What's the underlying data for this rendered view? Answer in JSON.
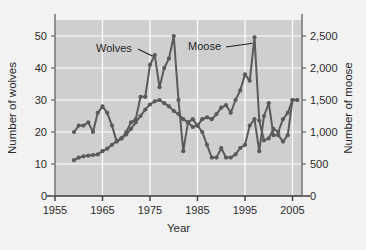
{
  "figure": {
    "background": "#f2f2f2",
    "plot_background": "#cfcfcf",
    "grid_color": "#ffffff",
    "axis_color": "#7a7a7a",
    "series_color": "#5a5a5a"
  },
  "labels": {
    "wolves_label": "Wolves",
    "moose_label": "Moose",
    "left_axis_title": "Number of wolves",
    "right_axis_title": "Number of moose",
    "x_axis_title": "Year"
  },
  "axes": {
    "x_ticks": [
      "1955",
      "1965",
      "1975",
      "1985",
      "1995",
      "2005"
    ],
    "y_left_ticks": [
      "0",
      "10",
      "20",
      "30",
      "40",
      "50"
    ],
    "y_right_ticks": [
      "0",
      "500",
      "1,000",
      "1,500",
      "2,000",
      "2,500"
    ]
  },
  "chart_data": {
    "type": "line",
    "title": "",
    "xlabel": "Year",
    "ylabel": "Number of wolves",
    "y2label": "Number of moose",
    "xlim": [
      1955,
      2007
    ],
    "ylim": [
      0,
      55
    ],
    "y2lim": [
      0,
      2750
    ],
    "grid": true,
    "legend": "annotated-inline",
    "x_ticks": [
      1955,
      1965,
      1975,
      1985,
      1995,
      2005
    ],
    "y_ticks": [
      0,
      10,
      20,
      30,
      40,
      50
    ],
    "y2_ticks": [
      0,
      500,
      1000,
      1500,
      2000,
      2500
    ],
    "series": [
      {
        "name": "Wolves",
        "axis": "left",
        "x": [
          1959,
          1960,
          1961,
          1962,
          1963,
          1964,
          1965,
          1966,
          1967,
          1968,
          1969,
          1970,
          1971,
          1972,
          1973,
          1974,
          1975,
          1976,
          1977,
          1978,
          1979,
          1980,
          1981,
          1982,
          1983,
          1984,
          1985,
          1986,
          1987,
          1988,
          1989,
          1990,
          1991,
          1992,
          1993,
          1994,
          1995,
          1996,
          1997,
          1998,
          1999,
          2000,
          2001,
          2002,
          2003,
          2004,
          2005,
          2006
        ],
        "values": [
          20,
          22,
          22,
          23,
          20,
          26,
          28,
          26,
          22,
          17,
          18,
          20,
          23,
          24,
          31,
          31,
          41,
          44,
          34,
          40,
          43,
          50,
          30,
          14,
          23,
          24,
          22,
          20,
          16,
          12,
          12,
          15,
          12,
          12,
          13,
          15,
          16,
          22,
          24,
          14,
          25,
          29,
          19,
          19,
          17,
          19,
          30,
          30
        ],
        "color": "#5a5a5a"
      },
      {
        "name": "Moose",
        "axis": "right",
        "x": [
          1959,
          1960,
          1961,
          1962,
          1963,
          1964,
          1965,
          1966,
          1967,
          1968,
          1969,
          1970,
          1971,
          1972,
          1973,
          1974,
          1975,
          1976,
          1977,
          1978,
          1979,
          1980,
          1981,
          1982,
          1983,
          1984,
          1985,
          1986,
          1987,
          1988,
          1989,
          1990,
          1991,
          1992,
          1993,
          1994,
          1995,
          1996,
          1997,
          1998,
          1999,
          2000,
          2001,
          2002,
          2003,
          2004,
          2005,
          2006
        ],
        "values": [
          560,
          600,
          620,
          630,
          640,
          650,
          700,
          740,
          800,
          860,
          900,
          960,
          1050,
          1150,
          1250,
          1350,
          1430,
          1480,
          1500,
          1450,
          1400,
          1330,
          1280,
          1200,
          1150,
          1080,
          1100,
          1200,
          1230,
          1200,
          1280,
          1380,
          1420,
          1300,
          1500,
          1650,
          1900,
          1800,
          2480,
          1180,
          870,
          900,
          1050,
          1000,
          1200,
          1300,
          1500,
          1500
        ],
        "color": "#5a5a5a"
      }
    ],
    "annotations": [
      {
        "text": "Wolves",
        "points_to_year": 1976,
        "points_to_value": 44
      },
      {
        "text": "Moose",
        "points_to_year": 1997,
        "points_to_value": 2480
      }
    ]
  }
}
